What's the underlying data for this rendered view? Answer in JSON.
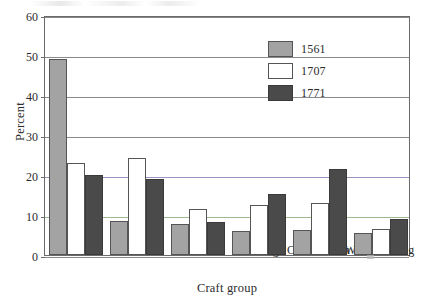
{
  "chart_data": {
    "type": "bar",
    "title": "",
    "xlabel": "Craft group",
    "ylabel": "Percent",
    "ylim": [
      0,
      60
    ],
    "yticks": [
      0,
      10,
      20,
      30,
      40,
      50,
      60
    ],
    "grid": true,
    "legend_position": "upper-right-inside",
    "categories": [
      "Textiles",
      "Leather",
      "Metals",
      "Clothing",
      "Construction",
      "Woodworking"
    ],
    "series": [
      {
        "name": "1561",
        "color": "#a3a3a3",
        "values": [
          49.0,
          8.5,
          7.8,
          6.0,
          6.2,
          5.4
        ]
      },
      {
        "name": "1707",
        "color": "#ffffff",
        "values": [
          23.0,
          24.2,
          11.4,
          12.5,
          13.0,
          6.4
        ]
      },
      {
        "name": "1771",
        "color": "#4a4a4a",
        "values": [
          20.0,
          19.0,
          8.3,
          15.2,
          21.5,
          8.9
        ]
      }
    ]
  }
}
